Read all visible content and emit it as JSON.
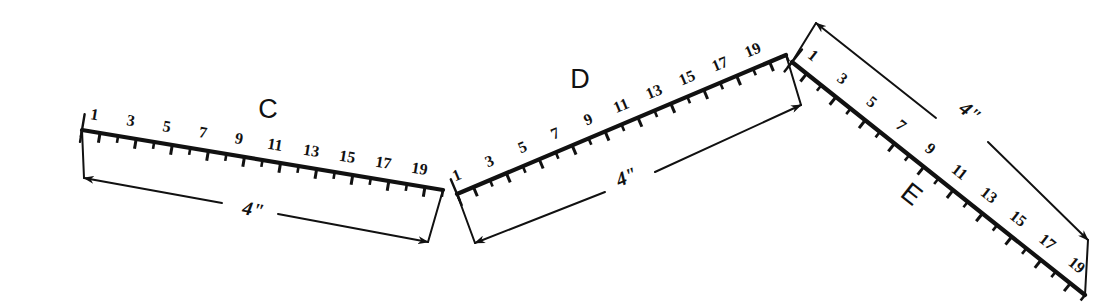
{
  "drawing": {
    "title": "Ruler measurement exercise: three chained scales C, D, E",
    "background_color": "#ffffff",
    "ink_color": "#111111",
    "width": 1094,
    "height": 307
  },
  "segments": [
    {
      "id": "C",
      "label": "C",
      "label_pos": {
        "x": 268,
        "y": 118
      },
      "start": {
        "x": 82,
        "y": 130
      },
      "end": {
        "x": 443,
        "y": 190
      },
      "num_ticks": 20,
      "tick_side": "above",
      "number_side": "below",
      "numbers": [
        "1",
        "3",
        "5",
        "7",
        "9",
        "11",
        "13",
        "15",
        "17",
        "19"
      ],
      "dimension": {
        "text": "4\"",
        "text_pos": {
          "x": 252,
          "y": 216
        },
        "from": {
          "x": 84,
          "y": 178
        },
        "to": {
          "x": 428,
          "y": 242
        },
        "gap_start": {
          "x": 222,
          "y": 203
        },
        "gap_end": {
          "x": 278,
          "y": 214
        }
      }
    },
    {
      "id": "D",
      "label": "D",
      "label_pos": {
        "x": 580,
        "y": 88
      },
      "start": {
        "x": 457,
        "y": 194
      },
      "end": {
        "x": 786,
        "y": 55
      },
      "num_ticks": 20,
      "tick_side": "above",
      "number_side": "below",
      "numbers": [
        "1",
        "3",
        "5",
        "7",
        "9",
        "11",
        "13",
        "15",
        "17",
        "19"
      ],
      "dimension": {
        "text": "4\"",
        "text_pos": {
          "x": 629,
          "y": 183
        },
        "from": {
          "x": 475,
          "y": 243
        },
        "to": {
          "x": 801,
          "y": 105
        },
        "gap_start": {
          "x": 605,
          "y": 192
        },
        "gap_end": {
          "x": 655,
          "y": 172
        }
      }
    },
    {
      "id": "E",
      "label": "E",
      "label_pos": {
        "x": 906,
        "y": 201
      },
      "start": {
        "x": 792,
        "y": 62
      },
      "end": {
        "x": 1085,
        "y": 295
      },
      "num_ticks": 20,
      "tick_side": "below-left",
      "number_side": "above-right",
      "numbers": [
        "1",
        "3",
        "5",
        "7",
        "9",
        "11",
        "13",
        "15",
        "17",
        "19"
      ],
      "dimension": {
        "text": "4\"",
        "text_pos": {
          "x": 966,
          "y": 117
        },
        "from": {
          "x": 816,
          "y": 23
        },
        "to": {
          "x": 1088,
          "y": 240
        },
        "gap_start": {
          "x": 936,
          "y": 118
        },
        "gap_end": {
          "x": 988,
          "y": 142
        }
      }
    }
  ],
  "vertices": [
    {
      "name": "vertex-c-d",
      "x": 447,
      "y": 191
    },
    {
      "name": "vertex-d-e",
      "x": 787,
      "y": 55
    }
  ],
  "notes": {
    "unit_symbol": "\"",
    "dimension_value": "4",
    "scale_count": 3
  }
}
